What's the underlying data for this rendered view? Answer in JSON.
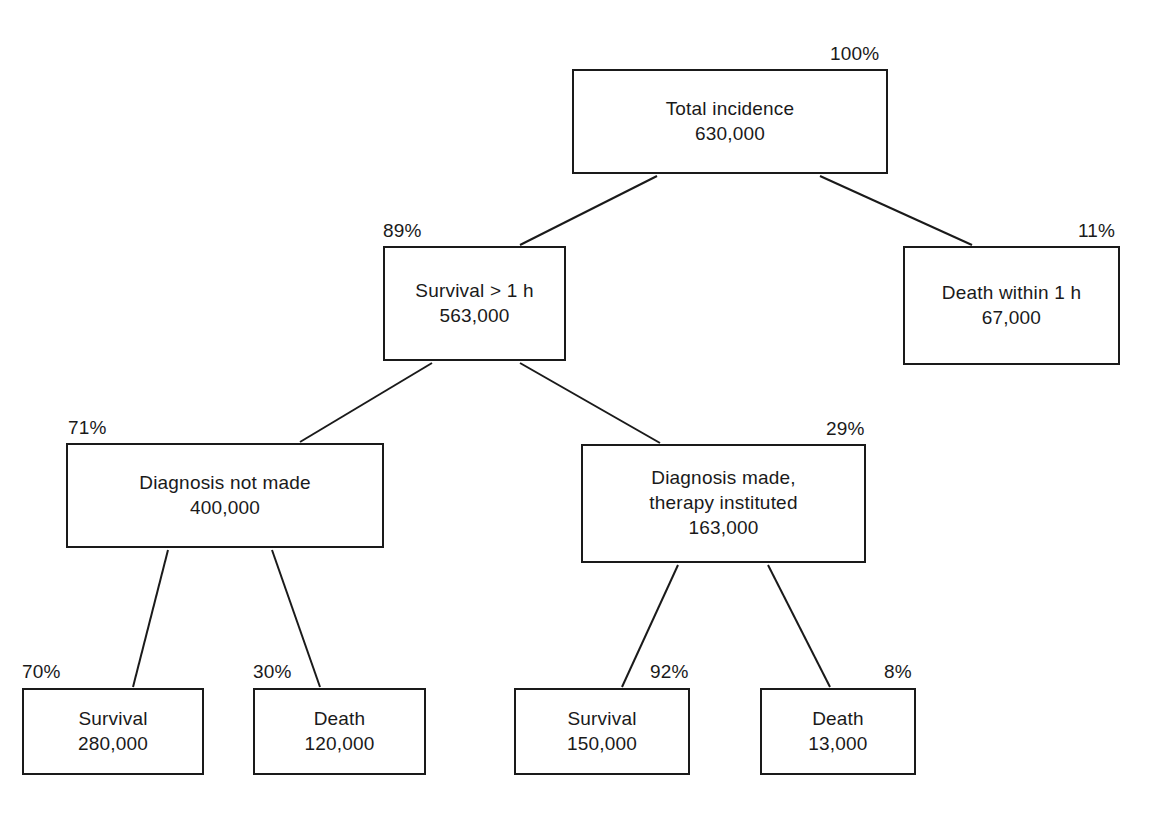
{
  "diagram": {
    "type": "tree-flowchart",
    "title": "",
    "nodes": [
      {
        "id": "total-incidence",
        "label_line1": "Total incidence",
        "label_line2": "630,000",
        "value": 630000,
        "percent": "100%",
        "level": 0
      },
      {
        "id": "survival-over-1h",
        "label_line1": "Survival > 1 h",
        "label_line2": "563,000",
        "value": 563000,
        "percent": "89%",
        "level": 1
      },
      {
        "id": "death-within-1h",
        "label_line1": "Death within 1 h",
        "label_line2": "67,000",
        "value": 67000,
        "percent": "11%",
        "level": 1
      },
      {
        "id": "diagnosis-not-made",
        "label_line1": "Diagnosis not made",
        "label_line2": "400,000",
        "value": 400000,
        "percent": "71%",
        "level": 2
      },
      {
        "id": "diagnosis-made",
        "label_line1": "Diagnosis made,",
        "label_line2": "therapy instituted",
        "label_line3": "163,000",
        "value": 163000,
        "percent": "29%",
        "level": 2
      },
      {
        "id": "survival-undiagnosed",
        "label_line1": "Survival",
        "label_line2": "280,000",
        "value": 280000,
        "percent": "70%",
        "level": 3
      },
      {
        "id": "death-undiagnosed",
        "label_line1": "Death",
        "label_line2": "120,000",
        "value": 120000,
        "percent": "30%",
        "level": 3
      },
      {
        "id": "survival-treated",
        "label_line1": "Survival",
        "label_line2": "150,000",
        "value": 150000,
        "percent": "92%",
        "level": 3
      },
      {
        "id": "death-treated",
        "label_line1": "Death",
        "label_line2": "13,000",
        "value": 13000,
        "percent": "8%",
        "level": 3
      }
    ],
    "colors": {
      "stroke": "#1a1a1a",
      "background": "#ffffff",
      "text": "#1a1a1a"
    }
  }
}
